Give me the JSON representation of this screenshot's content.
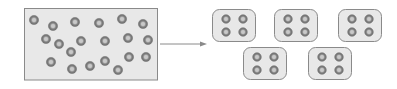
{
  "diagram": {
    "source": {
      "label": "unordered-particles",
      "particle_count": 20
    },
    "arrow": {
      "direction": "right"
    },
    "target": {
      "label": "clustered-groups",
      "group_count": 5,
      "particles_per_group": 4,
      "rows": [
        3,
        2
      ]
    },
    "colors": {
      "box_fill": "#e8e8e8",
      "box_stroke": "#8a8a8a",
      "particle_outer": "#7a7a7a",
      "particle_inner": "#c9c9c9",
      "arrow": "#8a8a8a"
    }
  }
}
